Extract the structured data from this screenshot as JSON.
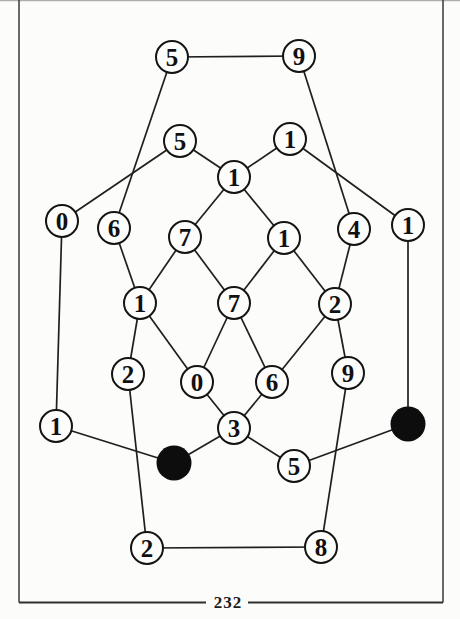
{
  "page": {
    "number": "232"
  },
  "colors": {
    "paper": "#fcfcfa",
    "frame_side": "#3a3a3a",
    "frame_bottom": "#2e2e2e",
    "frame_top": "#9c9c9c",
    "edge": "#1f1f1f",
    "node_stroke": "#141414",
    "node_fill": "#fdfdfc",
    "black_node_fill": "#0d0d0d",
    "digit": "#101010",
    "page_number_color": "#1c1c1c"
  },
  "graph": {
    "description": "puzzle graph of circled digits with two solid black nodes",
    "nodes": [
      {
        "id": "n1",
        "label": "5",
        "x": 172,
        "y": 57,
        "filled": false
      },
      {
        "id": "n2",
        "label": "9",
        "x": 299,
        "y": 56,
        "filled": false
      },
      {
        "id": "n3",
        "label": "5",
        "x": 180,
        "y": 141,
        "filled": false
      },
      {
        "id": "n4",
        "label": "1",
        "x": 290,
        "y": 139,
        "filled": false
      },
      {
        "id": "n5",
        "label": "1",
        "x": 234,
        "y": 177,
        "filled": false
      },
      {
        "id": "n6",
        "label": "0",
        "x": 62,
        "y": 221,
        "filled": false
      },
      {
        "id": "n7",
        "label": "6",
        "x": 114,
        "y": 228,
        "filled": false
      },
      {
        "id": "n8",
        "label": "7",
        "x": 185,
        "y": 237,
        "filled": false
      },
      {
        "id": "n9",
        "label": "1",
        "x": 284,
        "y": 238,
        "filled": false
      },
      {
        "id": "n10",
        "label": "4",
        "x": 354,
        "y": 229,
        "filled": false
      },
      {
        "id": "n11",
        "label": "1",
        "x": 408,
        "y": 225,
        "filled": false
      },
      {
        "id": "n12",
        "label": "1",
        "x": 140,
        "y": 303,
        "filled": false
      },
      {
        "id": "n13",
        "label": "7",
        "x": 234,
        "y": 303,
        "filled": false
      },
      {
        "id": "n14",
        "label": "2",
        "x": 335,
        "y": 304,
        "filled": false
      },
      {
        "id": "n15",
        "label": "2",
        "x": 128,
        "y": 374,
        "filled": false
      },
      {
        "id": "n16",
        "label": "0",
        "x": 197,
        "y": 382,
        "filled": false
      },
      {
        "id": "n17",
        "label": "6",
        "x": 272,
        "y": 382,
        "filled": false
      },
      {
        "id": "n18",
        "label": "9",
        "x": 348,
        "y": 373,
        "filled": false
      },
      {
        "id": "n19",
        "label": "1",
        "x": 56,
        "y": 426,
        "filled": false
      },
      {
        "id": "n20",
        "label": "3",
        "x": 234,
        "y": 428,
        "filled": false
      },
      {
        "id": "n21",
        "label": "",
        "x": 174,
        "y": 463,
        "filled": true
      },
      {
        "id": "n22",
        "label": "5",
        "x": 294,
        "y": 466,
        "filled": false
      },
      {
        "id": "n23",
        "label": "",
        "x": 408,
        "y": 424,
        "filled": true
      },
      {
        "id": "n24",
        "label": "2",
        "x": 147,
        "y": 548,
        "filled": false
      },
      {
        "id": "n25",
        "label": "8",
        "x": 321,
        "y": 547,
        "filled": false
      }
    ],
    "edges": [
      [
        "n1",
        "n2"
      ],
      [
        "n1",
        "n7"
      ],
      [
        "n2",
        "n10"
      ],
      [
        "n3",
        "n5"
      ],
      [
        "n3",
        "n6"
      ],
      [
        "n4",
        "n5"
      ],
      [
        "n4",
        "n11"
      ],
      [
        "n5",
        "n8"
      ],
      [
        "n5",
        "n9"
      ],
      [
        "n6",
        "n19"
      ],
      [
        "n7",
        "n12"
      ],
      [
        "n8",
        "n12"
      ],
      [
        "n8",
        "n13"
      ],
      [
        "n9",
        "n13"
      ],
      [
        "n9",
        "n14"
      ],
      [
        "n10",
        "n14"
      ],
      [
        "n11",
        "n23"
      ],
      [
        "n12",
        "n15"
      ],
      [
        "n12",
        "n16"
      ],
      [
        "n13",
        "n16"
      ],
      [
        "n13",
        "n17"
      ],
      [
        "n14",
        "n17"
      ],
      [
        "n14",
        "n18"
      ],
      [
        "n15",
        "n24"
      ],
      [
        "n16",
        "n20"
      ],
      [
        "n17",
        "n20"
      ],
      [
        "n18",
        "n25"
      ],
      [
        "n19",
        "n21"
      ],
      [
        "n20",
        "n21"
      ],
      [
        "n20",
        "n22"
      ],
      [
        "n22",
        "n23"
      ],
      [
        "n24",
        "n25"
      ]
    ]
  }
}
